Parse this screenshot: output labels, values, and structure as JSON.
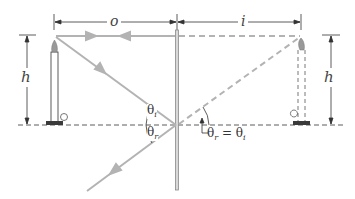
{
  "diagram": {
    "labels": {
      "object_distance": "o",
      "image_distance": "i",
      "object_height": "h",
      "image_height": "h",
      "theta_i": "θ",
      "theta_i_sub": "i",
      "theta_r": "θ",
      "theta_r_sub": "r",
      "equation_lhs": "θ",
      "equation_lhs_sub": "r",
      "equation_eq": " = θ",
      "equation_rhs_sub": "i"
    },
    "colors": {
      "ray": "#b3b3b3",
      "line": "#333333",
      "mirror": "#8a8a8a",
      "candle_base": "#3a3a3a",
      "flame": "#999999"
    }
  }
}
